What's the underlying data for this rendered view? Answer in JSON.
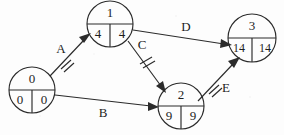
{
  "diagram": {
    "type": "activity-on-edge network",
    "stroke_color": "#2b2b2b",
    "background_color": "#fdfdfd",
    "nodes": [
      {
        "id": "node-0",
        "label": "0",
        "earliest": "0",
        "latest": "0",
        "cx": 32,
        "cy": 90,
        "r": 23
      },
      {
        "id": "node-1",
        "label": "1",
        "earliest": "4",
        "latest": "4",
        "cx": 110,
        "cy": 24,
        "r": 23
      },
      {
        "id": "node-2",
        "label": "2",
        "earliest": "9",
        "latest": "9",
        "cx": 181,
        "cy": 106,
        "r": 23
      },
      {
        "id": "node-3",
        "label": "3",
        "earliest": "14",
        "latest": "14",
        "cx": 252,
        "cy": 38,
        "r": 24
      }
    ],
    "edges": [
      {
        "id": "edge-a",
        "label": "A",
        "from": "node-0",
        "to": "node-1",
        "label_x": 61,
        "label_y": 50,
        "tick": true,
        "tick_x": 67,
        "tick_y": 58
      },
      {
        "id": "edge-b",
        "label": "B",
        "from": "node-0",
        "to": "node-2",
        "label_x": 103,
        "label_y": 114,
        "tick": false
      },
      {
        "id": "edge-c",
        "label": "C",
        "from": "node-1",
        "to": "node-2",
        "label_x": 142,
        "label_y": 46,
        "tick": true,
        "tick_x": 147,
        "tick_y": 64
      },
      {
        "id": "edge-d",
        "label": "D",
        "from": "node-1",
        "to": "node-3",
        "label_x": 186,
        "label_y": 28,
        "tick": false
      },
      {
        "id": "edge-e",
        "label": "E",
        "from": "node-2",
        "to": "node-3",
        "label_x": 224,
        "label_y": 89,
        "tick": true,
        "tick_x": 215,
        "tick_y": 89
      }
    ]
  }
}
